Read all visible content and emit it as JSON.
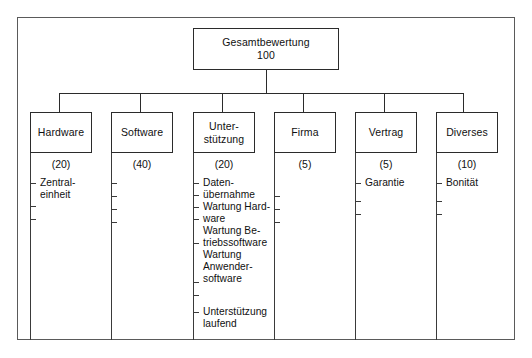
{
  "diagram": {
    "root": {
      "label": "Gesamtbewertung",
      "value": "100"
    },
    "categories": [
      {
        "id": "hardware",
        "label": "Hardware",
        "label_line2": "",
        "weight": "(20)",
        "items": [
          "Zentral-\neinheit"
        ],
        "tick_count": 3
      },
      {
        "id": "software",
        "label": "Software",
        "label_line2": "",
        "weight": "(40)",
        "items": [],
        "tick_count": 4
      },
      {
        "id": "unterstuetzung",
        "label": "Unter-",
        "label_line2": "stützung",
        "weight": "(20)",
        "items": [
          "Daten-\nübernahme",
          "Wartung Hard-\nware",
          "Wartung Be-\ntriebssoftware",
          "Wartung\nAnwender-\nsoftware",
          "Unterstützung\nlaufend"
        ],
        "tick_count": 7
      },
      {
        "id": "firma",
        "label": "Firma",
        "label_line2": "",
        "weight": "(5)",
        "items": [],
        "tick_count": 3
      },
      {
        "id": "vertrag",
        "label": "Vertrag",
        "label_line2": "",
        "weight": "(5)",
        "items": [
          "Garantie"
        ],
        "tick_count": 3
      },
      {
        "id": "diverses",
        "label": "Diverses",
        "label_line2": "",
        "weight": "(10)",
        "items": [
          "Bonität"
        ],
        "tick_count": 3
      }
    ],
    "colors": {
      "frame": "#5a5a5a",
      "stroke": "#2b2b2b",
      "spine": "#3a3a3a",
      "text": "#101010",
      "background": "#ffffff"
    }
  }
}
